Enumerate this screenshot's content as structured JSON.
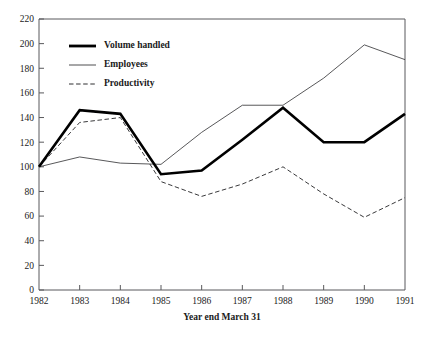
{
  "chart_data": {
    "type": "line",
    "title": "",
    "xlabel": "Year end March 31",
    "ylabel": "",
    "categories": [
      "1982",
      "1983",
      "1984",
      "1985",
      "1986",
      "1987",
      "1988",
      "1989",
      "1990",
      "1991"
    ],
    "x": [
      1982,
      1983,
      1984,
      1985,
      1986,
      1987,
      1988,
      1989,
      1990,
      1991
    ],
    "ylim": [
      0,
      220
    ],
    "yticks": [
      0,
      20,
      40,
      60,
      80,
      100,
      120,
      140,
      160,
      180,
      200,
      220
    ],
    "grid": false,
    "legend_position": "top-left-inside",
    "series": [
      {
        "name": "Volume handled",
        "style": "thick-solid",
        "values": [
          100,
          146,
          143,
          94,
          97,
          122,
          148,
          120,
          120,
          143
        ]
      },
      {
        "name": "Employees",
        "style": "thin-solid",
        "values": [
          100,
          108,
          103,
          102,
          128,
          150,
          150,
          172,
          199,
          187
        ]
      },
      {
        "name": "Productivity",
        "style": "dashed",
        "values": [
          100,
          136,
          140,
          88,
          76,
          86,
          100,
          78,
          59,
          75
        ]
      }
    ]
  },
  "axis": {
    "x_title": "Year end March 31",
    "y_tick_labels": [
      "0",
      "20",
      "40",
      "60",
      "80",
      "100",
      "120",
      "140",
      "160",
      "180",
      "200",
      "220"
    ],
    "x_tick_labels": [
      "1982",
      "1983",
      "1984",
      "1985",
      "1986",
      "1987",
      "1988",
      "1989",
      "1990",
      "1991"
    ]
  },
  "legend": {
    "items": [
      {
        "label": "Volume handled"
      },
      {
        "label": "Employees"
      },
      {
        "label": "Productivity"
      }
    ]
  },
  "colors": {
    "background": "#ffffff",
    "axis": "#59595c",
    "text": "#1a1a1a",
    "volume_handled": "#000000",
    "employees": "#3a3a3c",
    "productivity": "#2e2e30"
  }
}
